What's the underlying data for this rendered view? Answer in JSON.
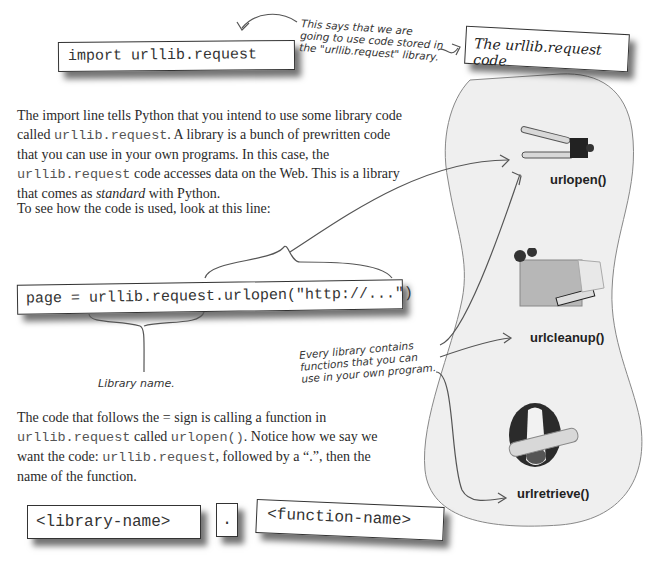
{
  "import_box": {
    "code": "import urllib.request"
  },
  "import_note": {
    "lines": [
      "This says that we are",
      "going to use code stored in",
      "the \"urllib.request\" library."
    ]
  },
  "library_panel": {
    "title": "The urllib.request code",
    "background": "#efefef",
    "functions": [
      {
        "name": "urlopen()",
        "icon": "can-opener-icon"
      },
      {
        "name": "urlcleanup()",
        "icon": "cleaning-box-icon"
      },
      {
        "name": "urlretrieve()",
        "icon": "dog-with-newspaper-icon"
      }
    ]
  },
  "paragraph1": {
    "t1": "The import line tells Python that you intend to use some library code called ",
    "c1": "urllib.request",
    "t2": ". A library is a bunch of prewritten code that you can use in your own programs. In this case, the ",
    "c2": "urllib.request",
    "t3": " code accesses data on the Web. This is a library that comes as ",
    "em": "standard",
    "t4": " with Python."
  },
  "paragraph2": {
    "text": "To see how the code is used, look at this line:"
  },
  "page_box": {
    "code": "page = urllib.request.urlopen(\"http://...\")"
  },
  "library_name_note": {
    "text": "Library name."
  },
  "functions_note": {
    "lines": [
      "Every library contains",
      "functions that you can",
      "use in your own program."
    ]
  },
  "paragraph3": {
    "t1": "The code that follows the = sign is calling a function in ",
    "c1": "urllib.request",
    "t2": " called ",
    "c2": "urlopen()",
    "t3": ". Notice how we say we want the code: ",
    "c3": "urllib.request",
    "t4": ", followed by a “.”, then the name of the function."
  },
  "syntax": {
    "library": "<library-name>",
    "dot": ".",
    "function": "<function-name>"
  }
}
